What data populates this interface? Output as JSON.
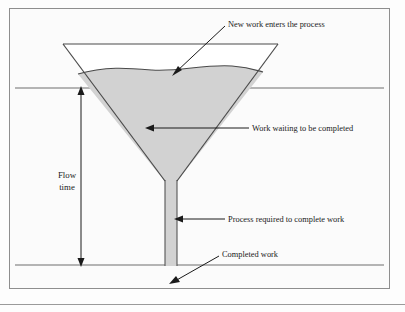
{
  "figure": {
    "type": "process-funnel-diagram",
    "frame": {
      "border_color": "#8e8e8e",
      "background": "#fbfbfb"
    },
    "funnel": {
      "fill_color": "#d2d2d2",
      "outline_color": "#4a4a4a",
      "empty_top_color": "#ffffff"
    },
    "reference_lines": {
      "color": "#6e6e6e",
      "upper_label": "",
      "lower_label": ""
    },
    "labels": [
      {
        "id": "new-work",
        "text": "New work enters the process",
        "anchor": "start",
        "x": 228,
        "y": 27
      },
      {
        "id": "work-waiting",
        "text": "Work waiting to be completed",
        "anchor": "start",
        "x": 252,
        "y": 131
      },
      {
        "id": "process-required",
        "text": "Process required to complete work",
        "anchor": "start",
        "x": 228,
        "y": 222
      },
      {
        "id": "completed-work",
        "text": "Completed work",
        "anchor": "start",
        "x": 222,
        "y": 257
      }
    ],
    "flow_time": {
      "line1": "Flow",
      "line2": "time",
      "x": 67,
      "y1": 178,
      "y2": 190,
      "arrow_top_y": 88,
      "arrow_bottom_y": 265,
      "arrow_x": 81
    }
  }
}
